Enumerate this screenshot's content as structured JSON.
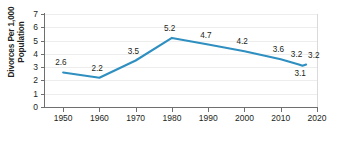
{
  "chart_data": {
    "type": "line",
    "title": "",
    "subtitle": "",
    "xlabel": "",
    "ylabel": "Divorces Per 1,000\nPopulation",
    "xlim": [
      1945,
      2020
    ],
    "ylim": [
      0,
      7
    ],
    "grid": true,
    "legend": false,
    "legend_position": "none",
    "line_color": "#2e8fc0",
    "x_tick_labels": [
      "1950",
      "1960",
      "1970",
      "1980",
      "1990",
      "2000",
      "2010",
      "2020"
    ],
    "x_ticks": [
      1950,
      1960,
      1970,
      1980,
      1990,
      2000,
      2010,
      2020
    ],
    "y_tick_labels": [
      "0",
      "1",
      "2",
      "3",
      "4",
      "5",
      "6",
      "7"
    ],
    "y_ticks": [
      0,
      1,
      2,
      3,
      4,
      5,
      6,
      7
    ],
    "x": [
      1950,
      1960,
      1970,
      1980,
      1990,
      2000,
      2010,
      2015,
      2016,
      2017
    ],
    "values": [
      2.6,
      2.2,
      3.5,
      5.2,
      4.7,
      4.2,
      3.6,
      3.2,
      3.1,
      3.2
    ],
    "point_labels": [
      {
        "text": "2.6",
        "x": 1950,
        "y": 2.6,
        "pos": "above"
      },
      {
        "text": "2.2",
        "x": 1960,
        "y": 2.2,
        "pos": "above"
      },
      {
        "text": "3.5",
        "x": 1970,
        "y": 3.5,
        "pos": "above"
      },
      {
        "text": "5.2",
        "x": 1980,
        "y": 5.2,
        "pos": "above"
      },
      {
        "text": "4.7",
        "x": 1990,
        "y": 4.7,
        "pos": "above"
      },
      {
        "text": "4.2",
        "x": 2000,
        "y": 4.2,
        "pos": "above"
      },
      {
        "text": "3.6",
        "x": 2010,
        "y": 3.6,
        "pos": "above"
      },
      {
        "text": "3.2",
        "x": 2015,
        "y": 3.2,
        "pos": "above"
      },
      {
        "text": "3.1",
        "x": 2016,
        "y": 3.1,
        "pos": "below"
      },
      {
        "text": "3.2",
        "x": 2017,
        "y": 3.2,
        "pos": "right"
      }
    ]
  }
}
